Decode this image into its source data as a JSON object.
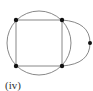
{
  "diagram": {
    "label": "(iv)",
    "stroke_color": "#888888",
    "vertex_color": "#111111",
    "circle": {
      "cx": 39,
      "cy": 43,
      "r": 32
    },
    "square": {
      "x1": 16,
      "y1": 20,
      "x2": 62,
      "y2": 66
    },
    "vertices": [
      {
        "id": "top-left",
        "x": 16,
        "y": 20
      },
      {
        "id": "top-right",
        "x": 62,
        "y": 20
      },
      {
        "id": "bottom-left",
        "x": 16,
        "y": 66
      },
      {
        "id": "bottom-right",
        "x": 62,
        "y": 66
      },
      {
        "id": "right",
        "x": 90,
        "y": 43
      }
    ],
    "extra_arc": {
      "from": "top-right",
      "through": "right",
      "to": "bottom-right"
    }
  }
}
